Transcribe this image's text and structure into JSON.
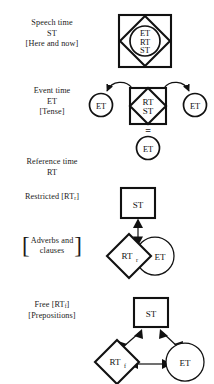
{
  "figure": {
    "background": "#ffffff",
    "ink": "#111111"
  },
  "rows": [
    {
      "id": "speech-time",
      "label_lines": [
        "Speech time",
        "ST"
      ],
      "bracket_line": "[Here and now]",
      "diagram": {
        "type": "square-diamond-circle",
        "square_label": "",
        "diamond_label": "",
        "circle_lines": [
          "ET",
          "RT",
          "ST"
        ]
      }
    },
    {
      "id": "event-time",
      "label_lines": [
        "Event time",
        "ET"
      ],
      "bracket_line": "[Tense]",
      "diagram": {
        "type": "square-diamond-with-flanking-circles",
        "diamond_lines": [
          "RT",
          "ST"
        ],
        "left_circle": "ET",
        "right_circle": "ET",
        "bottom_circle": "ET",
        "equals_sign": "="
      }
    },
    {
      "id": "reference-time",
      "label_lines": [
        "Reference time",
        "RT"
      ],
      "bracket_line": "",
      "diagram": {
        "type": "none"
      }
    },
    {
      "id": "restricted",
      "label_lines": [
        "Restricted [RT",
        "]"
      ],
      "label_text": "Restricted [RT",
      "label_subscript": "r",
      "label_tail": "]",
      "bracket_lines": [
        "Adverbs and",
        "clauses"
      ],
      "diagram": {
        "type": "st-over-overlapping-pair",
        "square_label": "ST",
        "diamond_label": "RT",
        "diamond_subscript": "r",
        "circle_label": "ET",
        "arrow": "double-headed-vertical"
      }
    },
    {
      "id": "free",
      "label_text": "Free [RT",
      "label_subscript": "f",
      "label_tail": "]",
      "bracket_line": "[Prepositions]",
      "diagram": {
        "type": "triangle-three-nodes",
        "square_label": "ST",
        "diamond_label": "RT",
        "diamond_subscript": "f",
        "circle_label": "ET",
        "arrows": [
          "double-headed-diagonal-left",
          "double-headed-diagonal-right",
          "double-headed-horizontal"
        ]
      }
    }
  ],
  "glyphs": {
    "et": "ET",
    "rt": "RT",
    "st": "ST",
    "equals": "="
  }
}
